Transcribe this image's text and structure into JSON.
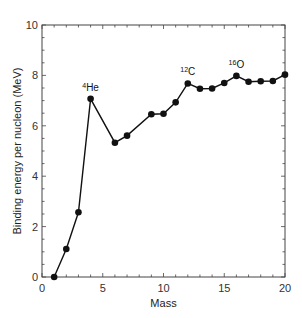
{
  "chart_data": {
    "type": "line",
    "title": "",
    "xlabel": "Mass",
    "ylabel": "Binding energy per nucleon (MeV)",
    "xlim": [
      0,
      20
    ],
    "ylim": [
      0,
      10
    ],
    "x_ticks": [
      0,
      5,
      10,
      15,
      20
    ],
    "y_ticks": [
      0,
      2,
      4,
      6,
      8,
      10
    ],
    "x_minor_step": 1,
    "y_minor_step": 0.5,
    "grid": false,
    "legend": null,
    "series": [
      {
        "name": "Binding energy per nucleon",
        "marker": "circle",
        "color": "#111111",
        "x": [
          1,
          2,
          3,
          4,
          6,
          7,
          9,
          10,
          11,
          12,
          13,
          14,
          15,
          16,
          17,
          18,
          19,
          20
        ],
        "values": [
          0,
          1.11,
          2.57,
          7.07,
          5.33,
          5.61,
          6.46,
          6.48,
          6.93,
          7.68,
          7.47,
          7.48,
          7.7,
          7.98,
          7.75,
          7.77,
          7.78,
          8.03
        ]
      }
    ],
    "annotations": [
      {
        "sup": "4",
        "text": "He",
        "x": 4,
        "y": 7.07
      },
      {
        "sup": "12",
        "text": "C",
        "x": 12,
        "y": 7.68
      },
      {
        "sup": "16",
        "text": "O",
        "x": 16,
        "y": 7.98
      }
    ]
  }
}
